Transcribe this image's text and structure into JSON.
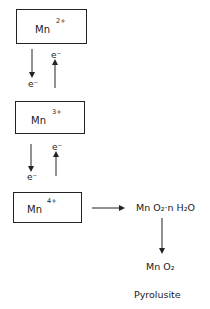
{
  "diagram": {
    "states": [
      {
        "element": "Mn",
        "charge": "2+"
      },
      {
        "element": "Mn",
        "charge": "3+"
      },
      {
        "element": "Mn",
        "charge": "4+"
      }
    ],
    "transitions": [
      {
        "down_label": "e⁻",
        "up_label": "e⁻"
      },
      {
        "down_label": "e⁻",
        "up_label": "e⁻"
      }
    ],
    "products": {
      "hydrated": "Mn O₂·n H₂O",
      "oxide": "Mn O₂",
      "mineral_name": "Pyrolusite"
    }
  }
}
